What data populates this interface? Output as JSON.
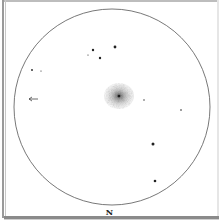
{
  "sketch": {
    "type": "eyepiece-drawing",
    "orientation_label": "N",
    "field_circle": {
      "cx": 112,
      "cy": 107,
      "r": 98,
      "stroke": "#555555"
    },
    "object": {
      "name": "galaxy",
      "cx": 119,
      "cy": 96,
      "rx": 15,
      "ry": 13,
      "core_color": "#222222",
      "halo_color": "#777777"
    },
    "stars": [
      {
        "x": 115,
        "y": 47,
        "r": 1.4
      },
      {
        "x": 93,
        "y": 50,
        "r": 1.2
      },
      {
        "x": 100,
        "y": 58,
        "r": 1.2
      },
      {
        "x": 88,
        "y": 55,
        "r": 0.6
      },
      {
        "x": 32,
        "y": 70,
        "r": 0.9
      },
      {
        "x": 41,
        "y": 71,
        "r": 0.6
      },
      {
        "x": 144,
        "y": 100,
        "r": 0.7
      },
      {
        "x": 181,
        "y": 110,
        "r": 0.8
      },
      {
        "x": 153,
        "y": 144,
        "r": 1.5
      },
      {
        "x": 155,
        "y": 181,
        "r": 1.3
      }
    ],
    "arrow": {
      "x1": 38,
      "y1": 99,
      "x2": 29,
      "y2": 99,
      "label": "direction-arrow"
    }
  }
}
